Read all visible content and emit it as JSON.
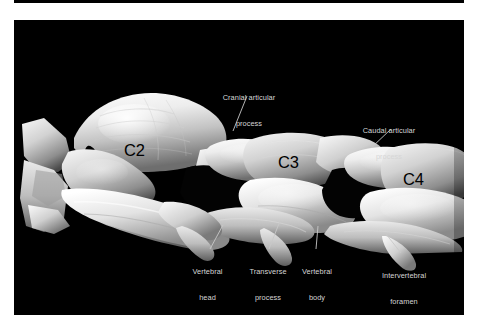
{
  "figure": {
    "kind": "anatomical-photograph",
    "plate_background": "#000000",
    "page_background": "#ffffff",
    "annotation_color": "#d6d6d6",
    "vertebra_label_color": "#000000",
    "leader_color": "#c8c8c8"
  },
  "vertebra_labels": [
    {
      "id": "c2",
      "text": "C2",
      "x": 124,
      "y": 151
    },
    {
      "id": "c3",
      "text": "C3",
      "x": 278,
      "y": 163
    },
    {
      "id": "c4",
      "text": "C4",
      "x": 403,
      "y": 180
    }
  ],
  "annotations": [
    {
      "id": "cranial-articular-process",
      "lines": [
        "Cranial articular",
        "process"
      ],
      "x": 211,
      "y": 77,
      "width": 76,
      "align": "center",
      "leader": {
        "x1": 247,
        "y1": 96,
        "x2": 233,
        "y2": 131
      }
    },
    {
      "id": "caudal-articular-process",
      "lines": [
        "Caudal articular",
        "process"
      ],
      "x": 352,
      "y": 110,
      "width": 74,
      "align": "center",
      "leader": {
        "x1": 391,
        "y1": 129,
        "x2": 371,
        "y2": 148
      }
    },
    {
      "id": "vertebral-head",
      "lines": [
        "Vertebral",
        "head"
      ],
      "x": 184,
      "y": 251,
      "width": 47,
      "align": "center",
      "leader": {
        "x1": 210,
        "y1": 249,
        "x2": 223,
        "y2": 225
      }
    },
    {
      "id": "transverse-process",
      "lines": [
        "Transverse",
        "process"
      ],
      "x": 241,
      "y": 251,
      "width": 54,
      "align": "center",
      "leader": {
        "x1": 269,
        "y1": 249,
        "x2": 280,
        "y2": 221
      }
    },
    {
      "id": "vertebral-body",
      "lines": [
        "Vertebral",
        "body"
      ],
      "x": 294,
      "y": 251,
      "width": 46,
      "align": "center",
      "leader": {
        "x1": 316,
        "y1": 249,
        "x2": 318,
        "y2": 226
      }
    },
    {
      "id": "intervertebral-foramen",
      "lines": [
        "Intervertebral",
        "foramen"
      ],
      "x": 373,
      "y": 255,
      "width": 62,
      "align": "center",
      "leader": {
        "x1": 401,
        "y1": 253,
        "x2": 386,
        "y2": 234
      }
    }
  ]
}
